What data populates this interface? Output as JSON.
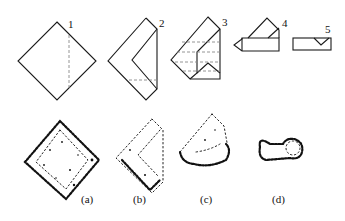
{
  "diagram": {
    "fold_steps": [
      {
        "label": "1"
      },
      {
        "label": "2"
      },
      {
        "label": "3"
      },
      {
        "label": "4"
      },
      {
        "label": "5"
      }
    ],
    "samples": [
      {
        "label": "(a)"
      },
      {
        "label": "(b)"
      },
      {
        "label": "(c)"
      },
      {
        "label": "(d)"
      }
    ],
    "colors": {
      "line": "#1a1a1a",
      "dashed_fold": "#888888",
      "background": "#ffffff"
    }
  }
}
